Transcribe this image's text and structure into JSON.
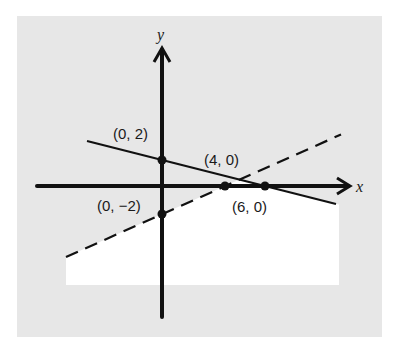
{
  "figure": {
    "background_color": "#ffffff",
    "panel_color": "#e7e7e7",
    "feasible_region_color": "#ffffff",
    "ink_color": "#111111"
  },
  "axes": {
    "x_label": "x",
    "y_label": "y"
  },
  "lines": [
    {
      "name": "solid-line",
      "style": "solid",
      "passes_through": [
        "(0, 2)",
        "(6, 0)"
      ]
    },
    {
      "name": "dashed-line",
      "style": "dashed",
      "passes_through": [
        "(0, -2)",
        "(4, 0)"
      ]
    }
  ],
  "points": [
    {
      "label": "(0, 2)",
      "x": 0,
      "y": 2
    },
    {
      "label": "(4, 0)",
      "x": 4,
      "y": 0
    },
    {
      "label": "(6, 0)",
      "x": 6,
      "y": 0
    },
    {
      "label": "(0, −2)",
      "x": 0,
      "y": -2
    }
  ],
  "shaded_region": "below solid line and below dashed line (unshaded white area)"
}
